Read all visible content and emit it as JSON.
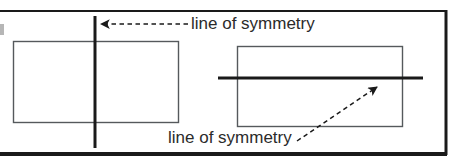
{
  "figure": {
    "background_color": "#ffffff",
    "ink_color": "#1a1a1a",
    "shape_stroke_color": "#55595c",
    "border": {
      "name": "outer-frame",
      "top_y": 10,
      "bottom_y": 154,
      "right_x": 446,
      "left_open": true,
      "top_thickness": 2,
      "bottom_thickness": 4,
      "right_thickness": 3
    },
    "labels": {
      "top": "line of symmetry",
      "bottom": "line of symmetry"
    },
    "shapes": [
      {
        "name": "left-rectangle",
        "type": "rectangle",
        "x": 13,
        "y": 41,
        "width": 165,
        "height": 81,
        "stroke": "#55595c",
        "stroke_width": 1.4
      },
      {
        "name": "right-rectangle",
        "type": "rectangle",
        "x": 237,
        "y": 46,
        "width": 165,
        "height": 80,
        "stroke": "#55595c",
        "stroke_width": 1.4
      }
    ],
    "symmetry_lines": [
      {
        "name": "vertical-symmetry-line",
        "orientation": "vertical",
        "x": 95,
        "y1": 16,
        "y2": 148,
        "stroke": "#1a1a1a",
        "stroke_width": 3
      },
      {
        "name": "horizontal-symmetry-line",
        "orientation": "horizontal",
        "y": 78,
        "x1": 218,
        "x2": 423,
        "stroke": "#1a1a1a",
        "stroke_width": 3
      }
    ],
    "pointers": [
      {
        "name": "top-pointer-arrow",
        "direction": "left",
        "from_x": 188,
        "from_y": 24,
        "to_x": 99,
        "to_y": 24,
        "style": "dashed",
        "stroke": "#1a1a1a",
        "stroke_width": 1.5
      },
      {
        "name": "bottom-pointer-arrow",
        "direction": "up-right",
        "from_x": 297,
        "from_y": 141,
        "to_x": 378,
        "to_y": 86,
        "style": "dashed",
        "stroke": "#1a1a1a",
        "stroke_width": 1.5
      }
    ]
  }
}
